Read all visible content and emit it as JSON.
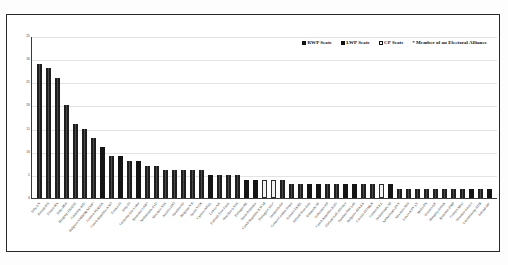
{
  "legend": {
    "items": [
      {
        "key": "rwp",
        "label": "RWP Seats",
        "color": "#3a3a3a"
      },
      {
        "key": "lwp",
        "label": "LWP Seats",
        "color": "#141414"
      },
      {
        "key": "cp",
        "label": "CP Seats",
        "color": "#ffffff"
      }
    ],
    "note": "* Member of an Electoral Alliance"
  },
  "chart_data": {
    "type": "bar",
    "title": "",
    "xlabel": "",
    "ylabel": "",
    "ylim": [
      0,
      35
    ],
    "yticks": [
      0,
      5,
      10,
      15,
      20,
      25,
      30,
      35
    ],
    "grid": true,
    "legend_position": "top-right",
    "series_key": "group",
    "series": [
      {
        "name": "RWP Seats",
        "color": "#3a3a3a"
      },
      {
        "name": "LWP Seats",
        "color": "#141414"
      },
      {
        "name": "CP Seats",
        "color": "#ffffff"
      }
    ],
    "categories": [
      "Italy-LN",
      "Poland-PiS",
      "France-RN",
      "Italy-M5S",
      "Hungary-FIDESZ",
      "Germany-AfD",
      "Bulgaria-VMRO&NFSB*",
      "Greece-SYRIZA",
      "Czech Republic-ANO",
      "France-FI",
      "Italy-FI",
      "Germany-Die Linke",
      "Romania-USR*",
      "Netherlands-FvD",
      "Slovakia-SNS",
      "Austria-FPO",
      "Sweden-SD",
      "Belgium-VB",
      "Spain-VOX",
      "Cyprus-AKEL",
      "Latvia-NA",
      "Finland-True Finns",
      "Slovakia-LSNS",
      "Portugal-BE",
      "Spain-Podemos",
      "Czech Republic-KSCM",
      "Portugal-CDU*",
      "Denmark-DF",
      "Greece-Golden Dawn",
      "Estonia-EKRE",
      "Ireland-Sinn Fein",
      "Denmark-SF",
      "Lithuania-DP",
      "Czech Republic-KDU",
      "Finland-Left Alliance",
      "Sweden-The Left",
      "Bulgaria-ATAKA",
      "Croatia-DOMEX",
      "Greece-KKE",
      "Netherlands-SP",
      "Netherlands-PVV",
      "Slovenia-SDS",
      "Latvia-KPV LV",
      "Malta-PN",
      "Estonia-EK",
      "Hungary-Jobbik",
      "Romania-PMP",
      "Croatia-Most",
      "Slovenia-Levica",
      "Luxembourg-ADR",
      "Ireland-I4C"
    ],
    "values": [
      29,
      28,
      26,
      20,
      16,
      15,
      13,
      11,
      9,
      9,
      8,
      8,
      7,
      7,
      6,
      6,
      6,
      6,
      6,
      5,
      5,
      5,
      5,
      4,
      4,
      4,
      4,
      4,
      3,
      3,
      3,
      3,
      3,
      3,
      3,
      3,
      3,
      3,
      3,
      3,
      2,
      2,
      2,
      2,
      2,
      2,
      2,
      2,
      2,
      2,
      2
    ],
    "group": [
      "rwp",
      "rwp",
      "rwp",
      "rwp",
      "rwp",
      "rwp",
      "rwp",
      "lwp",
      "rwp",
      "lwp",
      "rwp",
      "lwp",
      "rwp",
      "rwp",
      "rwp",
      "rwp",
      "rwp",
      "rwp",
      "rwp",
      "lwp",
      "rwp",
      "rwp",
      "rwp",
      "lwp",
      "lwp",
      "cp",
      "cp",
      "rwp",
      "rwp",
      "rwp",
      "lwp",
      "lwp",
      "rwp",
      "rwp",
      "lwp",
      "lwp",
      "rwp",
      "rwp",
      "cp",
      "lwp",
      "rwp",
      "rwp",
      "rwp",
      "rwp",
      "rwp",
      "rwp",
      "rwp",
      "rwp",
      "lwp",
      "rwp",
      "lwp"
    ]
  }
}
